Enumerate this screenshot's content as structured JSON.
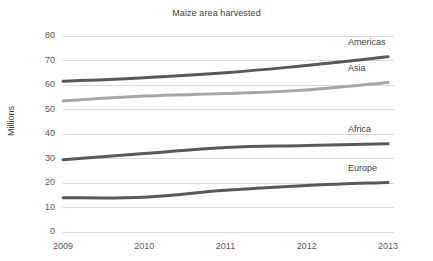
{
  "chart_data": {
    "type": "line",
    "title": "Maize area harvested",
    "xlabel": "",
    "ylabel": "Millions",
    "categories": [
      "2009",
      "2010",
      "2011",
      "2012",
      "2013"
    ],
    "x": [
      2009,
      2010,
      2011,
      2012,
      2013
    ],
    "ylim": [
      0,
      80
    ],
    "ytick_step": 10,
    "yticks": [
      "80",
      "70",
      "60",
      "50",
      "40",
      "30",
      "20",
      "10",
      "0"
    ],
    "ytick_values": [
      80,
      70,
      60,
      50,
      40,
      30,
      20,
      10,
      0
    ],
    "grid": "horizontal",
    "legend_position": "inline-right-of-line-end",
    "series": [
      {
        "name": "Americas",
        "values": [
          61.5,
          63.0,
          65.0,
          68.0,
          71.5
        ],
        "color": "#595959"
      },
      {
        "name": "Asia",
        "values": [
          53.5,
          55.5,
          56.5,
          58.0,
          61.0
        ],
        "color": "#a6a6a6"
      },
      {
        "name": "Africa",
        "values": [
          29.5,
          32.0,
          34.5,
          35.3,
          36.0
        ],
        "color": "#595959"
      },
      {
        "name": "Europe",
        "values": [
          14.0,
          14.2,
          17.0,
          19.0,
          20.2
        ],
        "color": "#595959"
      }
    ],
    "annotations": []
  },
  "style": {
    "background": "#ffffff",
    "grid_color": "#d9d9d9",
    "tick_label_color": "#595959",
    "title_color": "#404040",
    "line_width": 3
  }
}
